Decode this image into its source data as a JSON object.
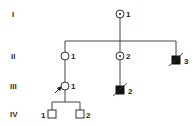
{
  "generations": [
    {
      "label": "I"
    },
    {
      "label": "II"
    },
    {
      "label": "III"
    },
    {
      "label": "IV"
    }
  ],
  "individuals": [
    {
      "id": "I-1",
      "generation": "I",
      "number": "1",
      "sex": "female",
      "status": "carrier",
      "deceased": false,
      "proband": false
    },
    {
      "id": "II-1",
      "generation": "II",
      "number": "1",
      "sex": "female",
      "status": "unaffected",
      "deceased": false,
      "proband": false
    },
    {
      "id": "II-2",
      "generation": "II",
      "number": "2",
      "sex": "female",
      "status": "carrier",
      "deceased": false,
      "proband": false
    },
    {
      "id": "II-3",
      "generation": "II",
      "number": "3",
      "sex": "male",
      "status": "affected",
      "deceased": true,
      "proband": false
    },
    {
      "id": "III-1",
      "generation": "III",
      "number": "1",
      "sex": "female",
      "status": "unaffected",
      "deceased": false,
      "proband": true
    },
    {
      "id": "III-2",
      "generation": "III",
      "number": "2",
      "sex": "male",
      "status": "affected",
      "deceased": true,
      "proband": false
    },
    {
      "id": "IV-1",
      "generation": "IV",
      "number": "1",
      "sex": "male",
      "status": "unaffected",
      "deceased": false,
      "proband": false
    },
    {
      "id": "IV-2",
      "generation": "IV",
      "number": "2",
      "sex": "male",
      "status": "unaffected",
      "deceased": false,
      "proband": false
    }
  ],
  "relationships": [
    {
      "parent": "I-1",
      "children": [
        "II-1",
        "II-2",
        "II-3"
      ]
    },
    {
      "parent": "II-1",
      "children": [
        "III-1"
      ]
    },
    {
      "parent": "II-2",
      "children": [
        "III-2"
      ]
    },
    {
      "parent": "III-1",
      "children": [
        "IV-1",
        "IV-2"
      ]
    }
  ],
  "colors": {
    "affected": "#111111",
    "unaffected": "#ffffff",
    "line": "#444444"
  }
}
